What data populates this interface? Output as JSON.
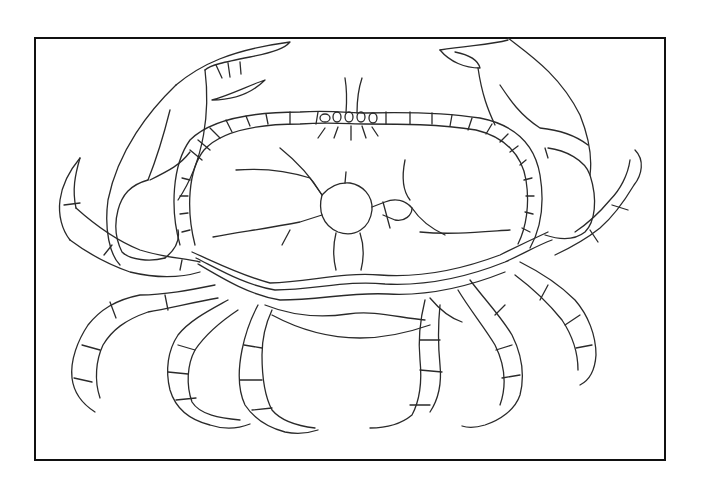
{
  "illustration": {
    "subject": "crab",
    "style": "black-and-white line drawing",
    "frame": {
      "border_color": "#111111",
      "background": "#ffffff"
    },
    "parts": [
      "left-claw",
      "right-claw",
      "carapace",
      "carapace-rim-segments",
      "eye-stalks",
      "abdomen",
      "left-walking-legs",
      "right-walking-legs"
    ]
  }
}
